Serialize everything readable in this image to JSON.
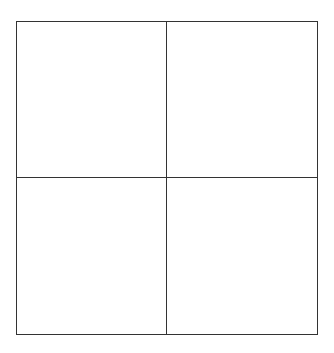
{
  "diagram": {
    "type": "grid",
    "rows": 2,
    "columns": 2,
    "line_color": "#333333",
    "background_color": "#ffffff",
    "cells": [
      {
        "row": 0,
        "col": 0,
        "label": ""
      },
      {
        "row": 0,
        "col": 1,
        "label": ""
      },
      {
        "row": 1,
        "col": 0,
        "label": ""
      },
      {
        "row": 1,
        "col": 1,
        "label": ""
      }
    ]
  }
}
